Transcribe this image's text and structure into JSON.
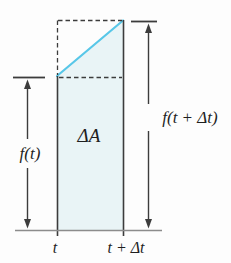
{
  "figure": {
    "labels": {
      "area": "ΔA",
      "left_height": "f(t)",
      "right_height": "f(t + Δt)",
      "axis_left": "t",
      "axis_right": "t + Δt"
    },
    "colors": {
      "secant_line": "#58c7e8",
      "area_fill": "#e9f4f6",
      "line": "#3c3c3c",
      "axis_line": "#8c8c8c",
      "text": "#1f1f1f"
    }
  }
}
